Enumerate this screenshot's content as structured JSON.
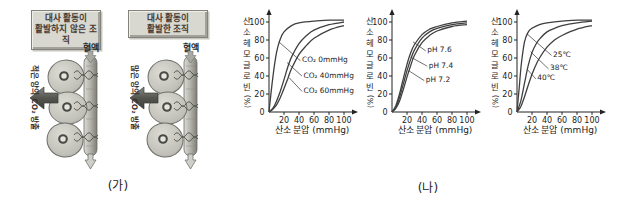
{
  "figure": {
    "panel_ga_label": "(가)",
    "panel_na_label": "(나)"
  },
  "tissue_panels": [
    {
      "caption_line1": "대사 활동이",
      "caption_line2": "활발하지 않은 조직",
      "blood_label": "혈액",
      "side_label": "적은 양의 CO₂ 방출"
    },
    {
      "caption_line1": "대사 활동이",
      "caption_line2": "활발한 조직",
      "blood_label": "혈액",
      "side_label": "많은 양의 CO₂ 방출"
    }
  ],
  "colors": {
    "curve": "#3f3f3f",
    "axis": "#232323",
    "text": "#1c1c1c",
    "leader": "#333333",
    "caption_box_fill": "#d8d8d1",
    "caption_text": "#463931",
    "arrow_fill": "#55554f"
  },
  "chart_data": [
    {
      "type": "line",
      "title": "",
      "xlabel": "산소 분압 (mmHg)",
      "ylabel": "산소헤모글로빈",
      "ylabel_unit": "(%)",
      "x_ticks": [
        20,
        40,
        60,
        80,
        100
      ],
      "y_ticks": [
        0,
        20,
        40,
        60,
        80,
        100
      ],
      "xlim": [
        0,
        107
      ],
      "ylim": [
        0,
        107
      ],
      "grid": false,
      "series": [
        {
          "name": "CO₂ 0mmHg",
          "points": [
            [
              0,
              0
            ],
            [
              5,
              38
            ],
            [
              10,
              66
            ],
            [
              15,
              81
            ],
            [
              20,
              89
            ],
            [
              30,
              96
            ],
            [
              40,
              99
            ],
            [
              60,
              101
            ],
            [
              80,
              102
            ],
            [
              100,
              102
            ]
          ],
          "label_pos": [
            44,
            58
          ],
          "arrow_to": [
            13,
            78
          ]
        },
        {
          "name": "CO₂ 40mmHg",
          "points": [
            [
              0,
              0
            ],
            [
              5,
              4
            ],
            [
              10,
              12
            ],
            [
              15,
              23
            ],
            [
              20,
              36
            ],
            [
              25,
              50
            ],
            [
              30,
              61
            ],
            [
              40,
              76
            ],
            [
              50,
              85
            ],
            [
              60,
              91
            ],
            [
              80,
              97
            ],
            [
              100,
              100
            ]
          ],
          "label_pos": [
            46,
            41
          ],
          "arrow_to": [
            24,
            55
          ]
        },
        {
          "name": "CO₂ 60mmHg",
          "points": [
            [
              0,
              0
            ],
            [
              5,
              3
            ],
            [
              10,
              8
            ],
            [
              15,
              16
            ],
            [
              20,
              26
            ],
            [
              25,
              37
            ],
            [
              30,
              48
            ],
            [
              40,
              64
            ],
            [
              50,
              74
            ],
            [
              60,
              82
            ],
            [
              80,
              91
            ],
            [
              100,
              96
            ]
          ],
          "label_pos": [
            46,
            24
          ],
          "arrow_to": [
            27,
            38
          ]
        }
      ]
    },
    {
      "type": "line",
      "title": "",
      "xlabel": "산소 분압 (mmHg)",
      "ylabel": "산소헤모글로빈",
      "ylabel_unit": "(%)",
      "x_ticks": [
        20,
        40,
        60,
        80,
        100
      ],
      "y_ticks": [
        0,
        20,
        40,
        60,
        80,
        100
      ],
      "xlim": [
        0,
        107
      ],
      "ylim": [
        0,
        107
      ],
      "grid": false,
      "series": [
        {
          "name": "pH 7.6",
          "points": [
            [
              0,
              0
            ],
            [
              5,
              7
            ],
            [
              10,
              20
            ],
            [
              15,
              37
            ],
            [
              20,
              53
            ],
            [
              25,
              66
            ],
            [
              30,
              75
            ],
            [
              40,
              86
            ],
            [
              50,
              92
            ],
            [
              60,
              95
            ],
            [
              80,
              99
            ],
            [
              100,
              101
            ]
          ],
          "label_pos": [
            47,
            69
          ],
          "arrow_to": [
            28,
            78
          ]
        },
        {
          "name": "pH 7.4",
          "points": [
            [
              0,
              0
            ],
            [
              5,
              5
            ],
            [
              10,
              16
            ],
            [
              15,
              31
            ],
            [
              20,
              46
            ],
            [
              25,
              59
            ],
            [
              30,
              69
            ],
            [
              40,
              82
            ],
            [
              50,
              89
            ],
            [
              60,
              93
            ],
            [
              80,
              97
            ],
            [
              100,
              99
            ]
          ],
          "label_pos": [
            49,
            52
          ],
          "arrow_to": [
            25,
            61
          ]
        },
        {
          "name": "pH 7.2",
          "points": [
            [
              0,
              0
            ],
            [
              5,
              4
            ],
            [
              10,
              12
            ],
            [
              15,
              25
            ],
            [
              20,
              39
            ],
            [
              25,
              52
            ],
            [
              30,
              63
            ],
            [
              40,
              77
            ],
            [
              50,
              85
            ],
            [
              60,
              90
            ],
            [
              80,
              95
            ],
            [
              100,
              97
            ]
          ],
          "label_pos": [
            45,
            36
          ],
          "arrow_to": [
            22,
            46
          ]
        }
      ]
    },
    {
      "type": "line",
      "title": "",
      "xlabel": "산소 분압 (mmHg)",
      "ylabel": "산소헤모글로빈",
      "ylabel_unit": "(%)",
      "x_ticks": [
        20,
        40,
        60,
        80,
        100
      ],
      "y_ticks": [
        0,
        20,
        40,
        60,
        80,
        100
      ],
      "xlim": [
        0,
        107
      ],
      "ylim": [
        0,
        107
      ],
      "grid": false,
      "series": [
        {
          "name": "25℃",
          "points": [
            [
              0,
              0
            ],
            [
              3,
              28
            ],
            [
              6,
              55
            ],
            [
              10,
              78
            ],
            [
              15,
              89
            ],
            [
              20,
              93
            ],
            [
              30,
              97
            ],
            [
              40,
              99
            ],
            [
              60,
              101
            ],
            [
              80,
              102
            ],
            [
              100,
              102
            ]
          ],
          "label_pos": [
            48,
            64
          ],
          "arrow_to": [
            13,
            87
          ]
        },
        {
          "name": "38℃",
          "points": [
            [
              0,
              0
            ],
            [
              5,
              12
            ],
            [
              10,
              32
            ],
            [
              15,
              52
            ],
            [
              20,
              66
            ],
            [
              25,
              75
            ],
            [
              30,
              81
            ],
            [
              40,
              89
            ],
            [
              50,
              93
            ],
            [
              60,
              96
            ],
            [
              80,
              99
            ],
            [
              100,
              101
            ]
          ],
          "label_pos": [
            44,
            49
          ],
          "arrow_to": [
            18,
            67
          ]
        },
        {
          "name": "40℃",
          "points": [
            [
              0,
              0
            ],
            [
              5,
              6
            ],
            [
              10,
              17
            ],
            [
              15,
              30
            ],
            [
              20,
              42
            ],
            [
              25,
              52
            ],
            [
              30,
              60
            ],
            [
              40,
              72
            ],
            [
              50,
              80
            ],
            [
              60,
              85
            ],
            [
              80,
              92
            ],
            [
              100,
              96
            ]
          ],
          "label_pos": [
            27,
            38
          ],
          "arrow_to": [
            14,
            47
          ]
        }
      ]
    }
  ]
}
